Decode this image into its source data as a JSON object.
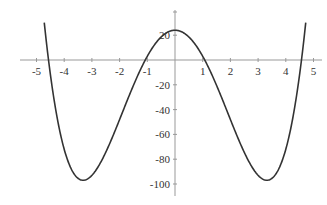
{
  "chart_data": {
    "type": "line",
    "title": "",
    "xlabel": "",
    "ylabel": "",
    "function": "x^4 - 22x^2 + 24",
    "xlim": [
      -5.5,
      5.5
    ],
    "ylim": [
      -105,
      30
    ],
    "grid": false,
    "x_ticks": [
      -5,
      -4,
      -3,
      -2,
      -1,
      1,
      2,
      3,
      4,
      5
    ],
    "y_ticks": [
      20,
      -20,
      -40,
      -60,
      -80,
      -100
    ],
    "series": [
      {
        "name": "f(x)",
        "color": "#333333",
        "x": [
          -4.75,
          -4.5,
          -4,
          -3.5,
          -3.32,
          -3,
          -2.5,
          -2,
          -1.5,
          -1,
          -0.5,
          0,
          0.5,
          1,
          1.5,
          2,
          2.5,
          3,
          3.32,
          3.5,
          4,
          4.5,
          4.75
        ],
        "values": [
          41.4,
          -20.4,
          -72,
          -95.4,
          -97,
          -93,
          -72.4,
          -48,
          -20.4,
          3,
          18.6,
          24,
          18.6,
          3,
          -20.4,
          -48,
          -72.4,
          -93,
          -97,
          -95.4,
          -72,
          -20.4,
          41.4
        ]
      }
    ]
  }
}
